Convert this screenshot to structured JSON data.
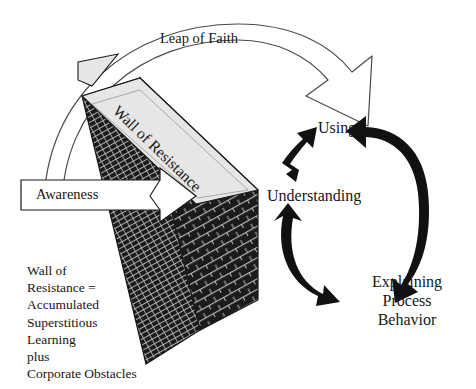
{
  "figure": {
    "background_color": "#ffffff",
    "ink_color": "#161616"
  },
  "labels": {
    "leap_of_faith": "Leap of Faith",
    "awareness": "Awareness",
    "wall_of_resistance": "Wall of Resistance",
    "using": "Using",
    "understanding": "Understanding",
    "explaining_process_behavior": "Explaining\nProcess\nBehavior"
  },
  "caption": {
    "wall_definition": "Wall of\nResistance =\nAccumulated\nSuperstitious\nLearning\nplus\nCorporate Obstacles"
  },
  "shapes": {
    "wall": {
      "name": "brick-wall",
      "brick_color": "#1b1b1b",
      "mortar_color": "#b9b9b9",
      "top_face_color": "#e6e6e6",
      "outline_color": "#1a1a1a"
    },
    "leap_arrow": {
      "name": "leap-of-faith-arrow",
      "style": "hollow-outlined-curved-arrow",
      "fill": "#ffffff",
      "stroke": "#3b3b3b",
      "direction": "left-to-right-over-wall",
      "heads": 1
    },
    "awareness_arrow": {
      "name": "awareness-block-arrow",
      "style": "hollow-block-arrow",
      "fill": "#ffffff",
      "stroke": "#1a1a1a",
      "direction": "right",
      "heads": 1
    },
    "cycle_arrows": [
      {
        "name": "understanding-using-arrow",
        "fill": "#111111",
        "heads": 2,
        "from": "Understanding",
        "to": "Using"
      },
      {
        "name": "using-explaining-arrow",
        "fill": "#111111",
        "heads": 2,
        "from": "Using",
        "to": "Explaining Process Behavior"
      },
      {
        "name": "understanding-explaining-arrow",
        "fill": "#111111",
        "heads": 2,
        "from": "Understanding",
        "to": "Explaining Process Behavior"
      }
    ]
  }
}
